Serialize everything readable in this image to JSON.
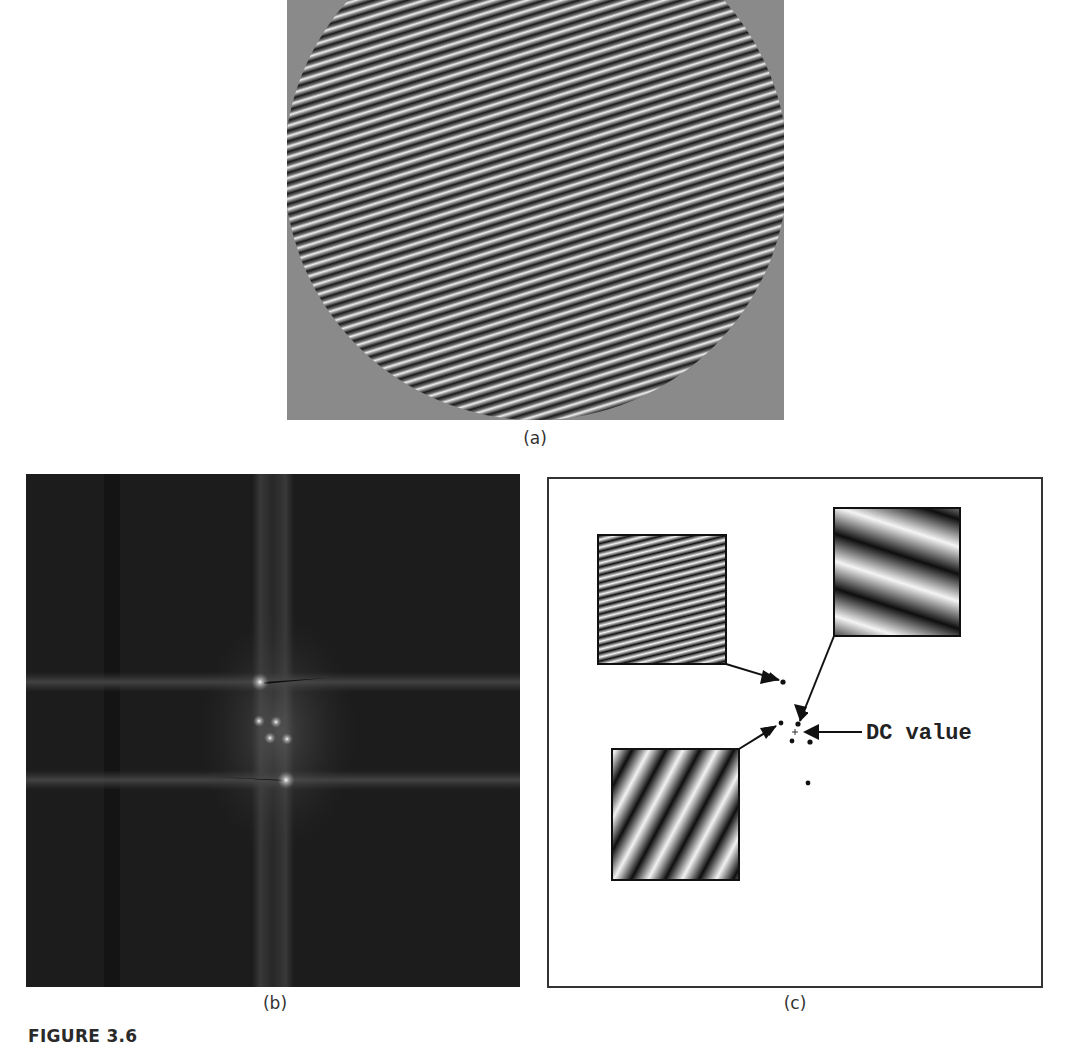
{
  "figure": {
    "caption": "FIGURE 3.6",
    "panels": [
      {
        "id": "a",
        "label": "(a)",
        "description": "Circular patch of the summed sinusoidal gratings on a mid-gray background",
        "background_color": "#8a8a8a"
      },
      {
        "id": "b",
        "label": "(b)",
        "description": "Fourier magnitude spectrum of image (a)",
        "background_color": "#1c1c1c",
        "bright_points": [
          {
            "x": 260,
            "y": 682
          },
          {
            "x": 259,
            "y": 721
          },
          {
            "x": 276,
            "y": 722
          },
          {
            "x": 270,
            "y": 738
          },
          {
            "x": 287,
            "y": 739
          },
          {
            "x": 286,
            "y": 780
          }
        ]
      },
      {
        "id": "c",
        "label": "(c)",
        "description": "Schematic mapping of each grating component to its spectral peaks",
        "annotation": "DC value",
        "gratings": [
          {
            "name": "high-frequency-grating",
            "position": "top-left"
          },
          {
            "name": "low-frequency-grating",
            "position": "top-right"
          },
          {
            "name": "mid-frequency-grating",
            "position": "bottom-left"
          }
        ]
      }
    ]
  }
}
